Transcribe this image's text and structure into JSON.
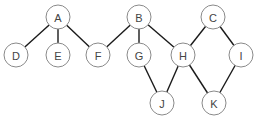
{
  "diagram": {
    "type": "graph",
    "node_radius": 12,
    "colors": {
      "edge": "#1a1a1a",
      "node_stroke": "#8a8a8a",
      "node_fill": "#ffffff",
      "label": "#444444"
    },
    "nodes": [
      {
        "id": "A",
        "label": "A",
        "x": 58,
        "y": 17
      },
      {
        "id": "B",
        "label": "B",
        "x": 139,
        "y": 17
      },
      {
        "id": "C",
        "label": "C",
        "x": 213,
        "y": 17
      },
      {
        "id": "D",
        "label": "D",
        "x": 16,
        "y": 55
      },
      {
        "id": "E",
        "label": "E",
        "x": 58,
        "y": 55
      },
      {
        "id": "F",
        "label": "F",
        "x": 98,
        "y": 55
      },
      {
        "id": "G",
        "label": "G",
        "x": 139,
        "y": 55
      },
      {
        "id": "H",
        "label": "H",
        "x": 183,
        "y": 55
      },
      {
        "id": "I",
        "label": "I",
        "x": 241,
        "y": 55
      },
      {
        "id": "J",
        "label": "J",
        "x": 162,
        "y": 103
      },
      {
        "id": "K",
        "label": "K",
        "x": 214,
        "y": 103
      }
    ],
    "edges": [
      [
        "A",
        "D"
      ],
      [
        "A",
        "E"
      ],
      [
        "A",
        "F"
      ],
      [
        "B",
        "F"
      ],
      [
        "B",
        "G"
      ],
      [
        "B",
        "H"
      ],
      [
        "C",
        "H"
      ],
      [
        "C",
        "I"
      ],
      [
        "G",
        "J"
      ],
      [
        "H",
        "J"
      ],
      [
        "H",
        "K"
      ],
      [
        "I",
        "K"
      ]
    ]
  }
}
